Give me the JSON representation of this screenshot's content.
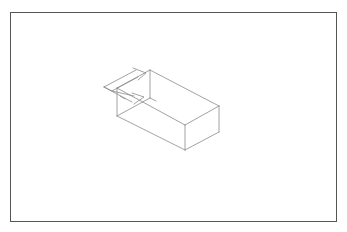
{
  "diagram": {
    "type": "isometric-wireframe",
    "frame": {
      "border_color": "#555555"
    },
    "line_color": "#8a8a8a",
    "box": {
      "vertices": {
        "back_top_left": [
          150,
          70
        ],
        "back_top_right": [
          219,
          106
        ],
        "front_top_right": [
          185,
          125
        ],
        "back_left_top": [
          117,
          88
        ],
        "back_left_bottom": [
          117,
          116
        ],
        "back_top_bottom": [
          150,
          98
        ],
        "back_right_bottom": [
          219,
          132
        ],
        "front_bottom": [
          185,
          150
        ]
      }
    },
    "arrows": [
      {
        "name": "upper-arrow",
        "direction": "into box"
      },
      {
        "name": "lower-arrow",
        "direction": "into box"
      }
    ]
  }
}
